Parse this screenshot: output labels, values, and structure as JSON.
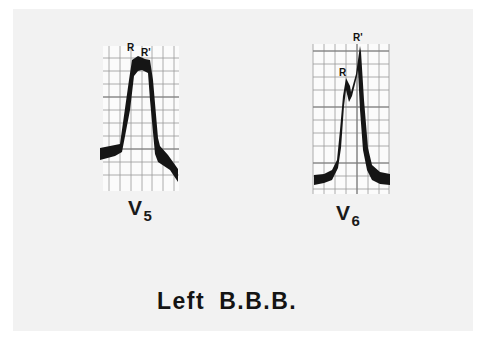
{
  "slide": {
    "background": "#f2f2f2",
    "caption": {
      "word1": "Left",
      "word2": "B.B.B."
    }
  },
  "leads": [
    {
      "name": "V5",
      "label_main": "V",
      "label_sub": "5",
      "peaks": [
        {
          "label": "R"
        },
        {
          "label": "R'"
        }
      ],
      "description": "Broad notched R wave with plateau (RR') — no Q, no S"
    },
    {
      "name": "V6",
      "label_main": "V",
      "label_sub": "6",
      "peaks": [
        {
          "label": "R"
        },
        {
          "label": "R'"
        }
      ],
      "description": "M-shaped R-R' complex with taller R'"
    }
  ],
  "colors": {
    "trace": "#151515",
    "grid": "#9a9a9a",
    "grid_paper": "#fbfbfb",
    "text": "#151515"
  }
}
